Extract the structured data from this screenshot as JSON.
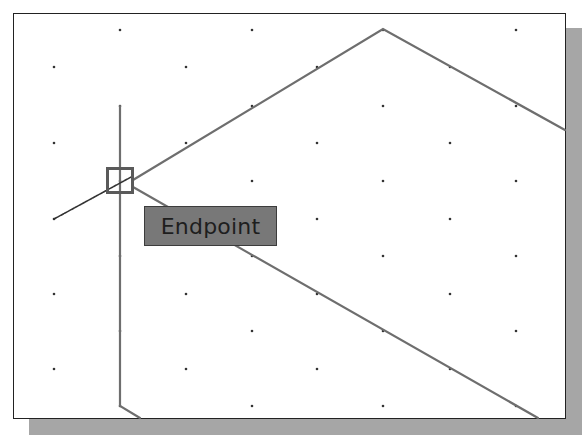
{
  "canvas": {
    "background": "#ffffff",
    "frame_color": "#222222",
    "shadow_color": "#a6a6a6",
    "geometry_color": "#6e6e6e",
    "grid_dot_color": "#333333"
  },
  "grid": {
    "rows_a": {
      "x": [
        54,
        186,
        317,
        450
      ],
      "y": [
        67,
        143,
        219,
        294,
        369
      ]
    },
    "rows_b": {
      "x": [
        120,
        252,
        383,
        516
      ],
      "y": [
        30,
        106,
        181,
        256,
        331,
        406
      ]
    }
  },
  "geometry": {
    "upper_edge": [
      [
        133,
        180
      ],
      [
        383,
        29
      ],
      [
        565,
        130
      ]
    ],
    "lower_edge": [
      [
        133,
        187
      ],
      [
        538,
        418
      ]
    ],
    "left_edge": [
      [
        120,
        106
      ],
      [
        120,
        406
      ],
      [
        140,
        418
      ]
    ],
    "rubber_band": [
      [
        54,
        219
      ],
      [
        133,
        176
      ]
    ]
  },
  "snap_marker": {
    "type": "endpoint",
    "x": 107,
    "y": 168,
    "size": 26
  },
  "tooltip": {
    "label": "Endpoint",
    "fill": "#787878",
    "text_color": "#1e1e1e"
  }
}
